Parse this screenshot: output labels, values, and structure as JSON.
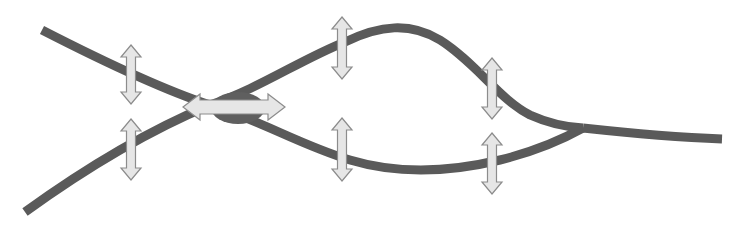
{
  "diagram": {
    "title": "",
    "colors": {
      "background": "#ffffff",
      "strand": "#5a5a5a",
      "knot": "#5f5f5f",
      "arrow_fill": "#e6e6e6",
      "arrow_stroke": "#8c8c8c"
    },
    "strand_width": 9,
    "strands": [
      {
        "name": "upper-left-to-lower-loop",
        "d": "M 42 30 C 120 70, 170 92, 210 105 C 260 120, 300 145, 350 160 C 400 175, 450 172, 500 160 C 540 150, 565 138, 583 128"
      },
      {
        "name": "lower-left-to-upper-loop",
        "d": "M 25 212 C 90 165, 150 130, 210 105 C 260 88, 300 60, 345 42 C 380 25, 410 22, 440 40 C 475 62, 500 100, 530 115 C 550 124, 565 127, 583 128"
      },
      {
        "name": "merged-tail",
        "d": "M 583 128 C 620 132, 670 137, 722 139"
      }
    ],
    "knot": {
      "cx": 238,
      "cy": 108,
      "rx": 27,
      "ry": 16
    },
    "arrows": [
      {
        "id": "horizontal-center",
        "orientation": "horizontal",
        "x1": 183,
        "x2": 285,
        "y": 107,
        "shaft": 14,
        "head": 26,
        "head_len": 17
      },
      {
        "id": "v1-top",
        "orientation": "vertical",
        "x": 131,
        "y1": 45,
        "y2": 104,
        "shaft": 9,
        "head": 20,
        "head_len": 12
      },
      {
        "id": "v1-bottom",
        "orientation": "vertical",
        "x": 131,
        "y1": 119,
        "y2": 180,
        "shaft": 9,
        "head": 20,
        "head_len": 12
      },
      {
        "id": "v2-top",
        "orientation": "vertical",
        "x": 342,
        "y1": 17,
        "y2": 79,
        "shaft": 9,
        "head": 20,
        "head_len": 12
      },
      {
        "id": "v2-bottom",
        "orientation": "vertical",
        "x": 342,
        "y1": 118,
        "y2": 181,
        "shaft": 9,
        "head": 20,
        "head_len": 12
      },
      {
        "id": "v3-top",
        "orientation": "vertical",
        "x": 492,
        "y1": 58,
        "y2": 119,
        "shaft": 9,
        "head": 20,
        "head_len": 12
      },
      {
        "id": "v3-bottom",
        "orientation": "vertical",
        "x": 492,
        "y1": 133,
        "y2": 194,
        "shaft": 9,
        "head": 20,
        "head_len": 12
      }
    ]
  }
}
